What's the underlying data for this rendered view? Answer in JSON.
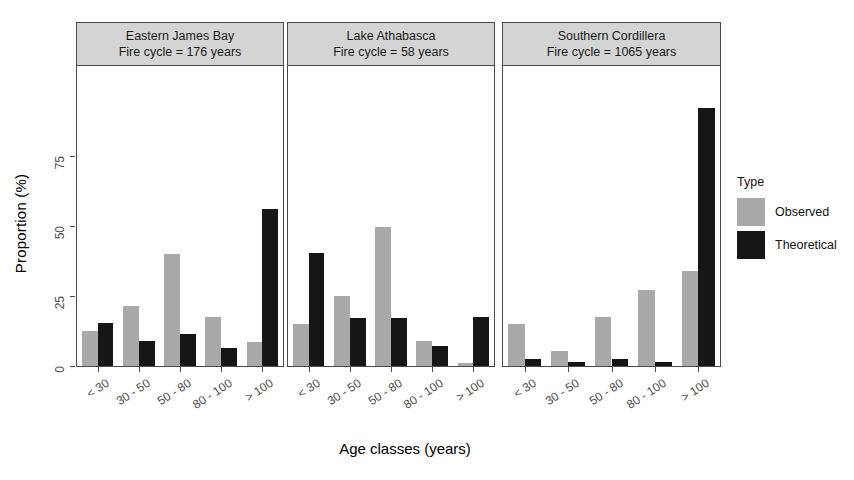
{
  "chart_data": {
    "type": "bar",
    "title": "",
    "xlabel": "Age classes (years)",
    "ylabel": "Proportion (%)",
    "categories": [
      "< 30",
      "30 - 50",
      "50 - 80",
      "80 - 100",
      "> 100"
    ],
    "ylim": [
      0,
      100
    ],
    "yticks": [
      0,
      25,
      50,
      75
    ],
    "ytick_labels": [
      "0",
      "25",
      "50",
      "75"
    ],
    "grid": false,
    "legend_title": "Type",
    "legend_position": "right",
    "series_names": [
      "Observed",
      "Theoretical"
    ],
    "series_colors": [
      "#a9a9a9",
      "#161616"
    ],
    "panels": [
      {
        "title_line1": "Eastern James Bay",
        "title_line2": "Fire cycle = 176 years",
        "series": [
          {
            "name": "Observed",
            "values": [
              12.5,
              21.5,
              40.0,
              17.5,
              8.5
            ]
          },
          {
            "name": "Theoretical",
            "values": [
              15.5,
              9.0,
              11.5,
              6.5,
              56.0
            ]
          }
        ]
      },
      {
        "title_line1": "Lake Athabasca",
        "title_line2": "Fire cycle = 58 years",
        "series": [
          {
            "name": "Observed",
            "values": [
              15.0,
              25.0,
              49.5,
              9.0,
              1.0
            ]
          },
          {
            "name": "Theoretical",
            "values": [
              40.5,
              17.0,
              17.0,
              7.0,
              17.5
            ]
          }
        ]
      },
      {
        "title_line1": "Southern Cordillera",
        "title_line2": "Fire cycle = 1065 years",
        "series": [
          {
            "name": "Observed",
            "values": [
              15.0,
              5.5,
              17.5,
              27.0,
              34.0
            ]
          },
          {
            "name": "Theoretical",
            "values": [
              2.5,
              1.5,
              2.5,
              1.5,
              92.0
            ]
          }
        ]
      }
    ]
  },
  "axes": {
    "y_title": "Proportion (%)",
    "x_title": "Age classes (years)",
    "y_tick_labels": [
      "0",
      "25",
      "50",
      "75"
    ],
    "x_tick_labels": [
      "< 30",
      "30 - 50",
      "50 - 80",
      "80 - 100",
      "> 100"
    ]
  },
  "legend": {
    "title": "Type",
    "entries": [
      {
        "label": "Observed",
        "color": "#a9a9a9"
      },
      {
        "label": "Theoretical",
        "color": "#161616"
      }
    ]
  }
}
